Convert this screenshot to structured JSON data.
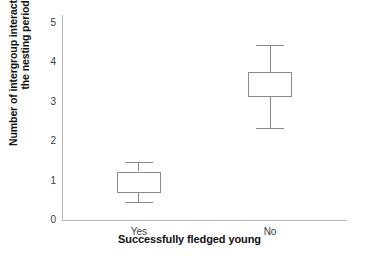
{
  "chart_data": {
    "type": "box",
    "title": "",
    "xlabel": "Successfully fledged young",
    "ylabel_line1": "Number of intergroup interactions during",
    "ylabel_line2": "the nesting period",
    "categories": [
      "Yes",
      "No"
    ],
    "ytick_labels": [
      "5",
      "4",
      "3",
      "2",
      "1",
      "0"
    ],
    "ytick_values": [
      5,
      4,
      3,
      2,
      1,
      0
    ],
    "ylim": [
      0,
      5.2
    ],
    "grid": false,
    "legend": null,
    "boxes": [
      {
        "category": "Yes",
        "whisker_low": 0.45,
        "q1": 0.68,
        "median": null,
        "q3": 1.23,
        "whisker_high": 1.48
      },
      {
        "category": "No",
        "whisker_low": 2.33,
        "q1": 3.13,
        "median": null,
        "q3": 3.75,
        "whisker_high": 4.45
      }
    ],
    "colors": {
      "box_stroke": "#8a8a8a",
      "axis": "#b9b9b9",
      "text": "#111111",
      "tick_text": "#3a3a3a",
      "background": "#ffffff"
    }
  }
}
